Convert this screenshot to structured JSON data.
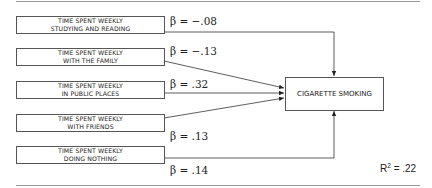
{
  "diagram": {
    "predictors": [
      {
        "line1": "Time spent weekly",
        "line2": "studying and reading",
        "beta": "β = −.08"
      },
      {
        "line1": "Time spent weekly",
        "line2": "with the family",
        "beta": "β = −.13"
      },
      {
        "line1": "Time spent weekly",
        "line2": "in public places",
        "beta": "β = .32"
      },
      {
        "line1": "Time spent weekly",
        "line2": "with friends",
        "beta": "β = .13"
      },
      {
        "line1": "Time spent weekly",
        "line2": "doing nothing",
        "beta": "β = .14"
      }
    ],
    "outcome": "Cigarette smoking",
    "r2_label": "R",
    "r2_sup": "2",
    "r2_value": " = .22"
  },
  "colors": {
    "line": "#333333",
    "rule": "#9a9a9a",
    "box_border": "#555555"
  }
}
